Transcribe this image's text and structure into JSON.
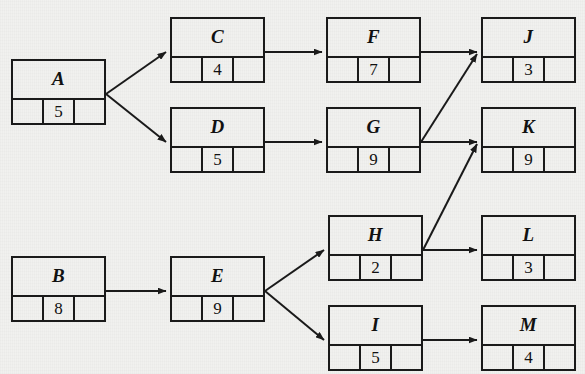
{
  "diagram": {
    "background_color": "#f1f1ef",
    "line_color": "#1a1a1a",
    "nodes": [
      {
        "id": "A",
        "label": "A",
        "value": "5",
        "x": 11,
        "y": 59,
        "w": 95,
        "h": 66
      },
      {
        "id": "B",
        "label": "B",
        "value": "8",
        "x": 11,
        "y": 256,
        "w": 95,
        "h": 66
      },
      {
        "id": "C",
        "label": "C",
        "value": "4",
        "x": 170,
        "y": 17,
        "w": 95,
        "h": 66
      },
      {
        "id": "D",
        "label": "D",
        "value": "5",
        "x": 170,
        "y": 107,
        "w": 95,
        "h": 66
      },
      {
        "id": "E",
        "label": "E",
        "value": "9",
        "x": 170,
        "y": 256,
        "w": 95,
        "h": 66
      },
      {
        "id": "F",
        "label": "F",
        "value": "7",
        "x": 326,
        "y": 17,
        "w": 95,
        "h": 66
      },
      {
        "id": "G",
        "label": "G",
        "value": "9",
        "x": 326,
        "y": 107,
        "w": 95,
        "h": 66
      },
      {
        "id": "H",
        "label": "H",
        "value": "2",
        "x": 328,
        "y": 215,
        "w": 95,
        "h": 66
      },
      {
        "id": "I",
        "label": "I",
        "value": "5",
        "x": 328,
        "y": 305,
        "w": 95,
        "h": 66
      },
      {
        "id": "J",
        "label": "J",
        "value": "3",
        "x": 481,
        "y": 17,
        "w": 95,
        "h": 66
      },
      {
        "id": "K",
        "label": "K",
        "value": "9",
        "x": 481,
        "y": 107,
        "w": 95,
        "h": 66
      },
      {
        "id": "L",
        "label": "L",
        "value": "3",
        "x": 481,
        "y": 215,
        "w": 95,
        "h": 66
      },
      {
        "id": "M",
        "label": "M",
        "value": "4",
        "x": 481,
        "y": 305,
        "w": 95,
        "h": 66
      }
    ],
    "edges": [
      {
        "from": "A",
        "to": "C",
        "x1": 106,
        "y1": 94,
        "x2": 166,
        "y2": 52
      },
      {
        "from": "A",
        "to": "D",
        "x1": 106,
        "y1": 94,
        "x2": 166,
        "y2": 142
      },
      {
        "from": "C",
        "to": "F",
        "x1": 265,
        "y1": 52,
        "x2": 322,
        "y2": 52
      },
      {
        "from": "D",
        "to": "G",
        "x1": 265,
        "y1": 142,
        "x2": 322,
        "y2": 142
      },
      {
        "from": "F",
        "to": "J",
        "x1": 421,
        "y1": 52,
        "x2": 477,
        "y2": 52
      },
      {
        "from": "G",
        "to": "J",
        "x1": 421,
        "y1": 142,
        "x2": 477,
        "y2": 54
      },
      {
        "from": "G",
        "to": "K",
        "x1": 421,
        "y1": 142,
        "x2": 477,
        "y2": 142
      },
      {
        "from": "B",
        "to": "E",
        "x1": 106,
        "y1": 291,
        "x2": 166,
        "y2": 291
      },
      {
        "from": "E",
        "to": "H",
        "x1": 265,
        "y1": 291,
        "x2": 324,
        "y2": 250
      },
      {
        "from": "E",
        "to": "I",
        "x1": 265,
        "y1": 291,
        "x2": 324,
        "y2": 340
      },
      {
        "from": "H",
        "to": "K",
        "x1": 423,
        "y1": 250,
        "x2": 477,
        "y2": 144
      },
      {
        "from": "H",
        "to": "L",
        "x1": 423,
        "y1": 250,
        "x2": 477,
        "y2": 250
      },
      {
        "from": "I",
        "to": "M",
        "x1": 423,
        "y1": 340,
        "x2": 477,
        "y2": 340
      }
    ]
  }
}
